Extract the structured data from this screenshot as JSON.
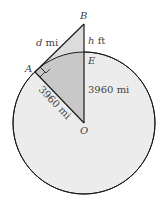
{
  "diagram": {
    "colors": {
      "circle_fill": "#ececec",
      "triangle_fill": "#dcdcdc",
      "sector_fill": "#c8c8c8",
      "stroke": "#1a1a1a",
      "label": "#444444"
    },
    "points": {
      "B": {
        "label": "B"
      },
      "A": {
        "label": "A"
      },
      "E": {
        "label": "E"
      },
      "O": {
        "label": "O"
      }
    },
    "labels": {
      "tangent": {
        "var": "d",
        "unit": " mi"
      },
      "height": {
        "var": "h",
        "unit": " ft"
      },
      "radius_vertical": "3960 mi",
      "radius_slanted": "3960 mi"
    }
  }
}
